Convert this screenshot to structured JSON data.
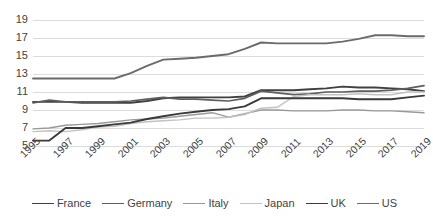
{
  "chart_data": {
    "type": "line",
    "title": "",
    "subtitle": "",
    "xlabel": "",
    "ylabel": "",
    "grid": true,
    "legend_position": "bottom",
    "ylim": [
      5,
      19
    ],
    "yticks": [
      5,
      7,
      9,
      11,
      13,
      15,
      17,
      19
    ],
    "xticks": [
      "1995",
      "1997",
      "1999",
      "2001",
      "2003",
      "2005",
      "2007",
      "2009",
      "2011",
      "2013",
      "2015",
      "2017",
      "2019"
    ],
    "x": [
      1995,
      1996,
      1997,
      1998,
      1999,
      2000,
      2001,
      2002,
      2003,
      2004,
      2005,
      2006,
      2007,
      2008,
      2009,
      2010,
      2011,
      2012,
      2013,
      2014,
      2015,
      2016,
      2017,
      2018,
      2019
    ],
    "series": [
      {
        "name": "France",
        "color": "#404040",
        "width": 1.9,
        "values": [
          9.9,
          9.9,
          9.9,
          9.8,
          9.8,
          9.8,
          9.8,
          10.0,
          10.3,
          10.4,
          10.4,
          10.4,
          10.4,
          10.5,
          11.2,
          11.2,
          11.2,
          11.3,
          11.4,
          11.6,
          11.5,
          11.5,
          11.4,
          11.3,
          11.1
        ]
      },
      {
        "name": "Germany",
        "color": "#5e5e5e",
        "width": 1.7,
        "values": [
          9.8,
          10.1,
          9.9,
          9.9,
          9.9,
          9.9,
          10.0,
          10.2,
          10.4,
          10.2,
          10.2,
          10.1,
          10.0,
          10.3,
          11.1,
          10.9,
          10.7,
          10.8,
          11.0,
          11.0,
          11.1,
          11.1,
          11.2,
          11.4,
          11.7
        ]
      },
      {
        "name": "Italy",
        "color": "#999999",
        "width": 1.4,
        "values": [
          6.9,
          7.0,
          7.3,
          7.4,
          7.5,
          7.7,
          7.9,
          8.0,
          8.1,
          8.3,
          8.5,
          8.7,
          8.2,
          8.6,
          9.0,
          9.0,
          8.9,
          8.9,
          8.9,
          9.0,
          9.0,
          8.9,
          8.9,
          8.8,
          8.7
        ]
      },
      {
        "name": "Japan",
        "color": "#c2c2c2",
        "width": 1.4,
        "values": [
          6.6,
          6.7,
          6.6,
          6.8,
          7.1,
          7.2,
          7.5,
          7.7,
          7.8,
          7.9,
          8.1,
          8.1,
          8.2,
          8.5,
          9.2,
          9.3,
          10.5,
          10.7,
          10.7,
          10.7,
          10.8,
          10.7,
          10.7,
          11.0,
          11.0
        ]
      },
      {
        "name": "UK",
        "color": "#3a3a3a",
        "width": 1.9,
        "values": [
          5.6,
          5.6,
          7.0,
          7.0,
          7.2,
          7.4,
          7.6,
          8.0,
          8.3,
          8.6,
          8.8,
          9.0,
          9.1,
          9.4,
          10.3,
          10.3,
          10.3,
          10.3,
          10.3,
          10.3,
          10.2,
          10.2,
          10.2,
          10.4,
          10.6
        ]
      },
      {
        "name": "US",
        "color": "#6b6b6b",
        "width": 1.9,
        "values": [
          12.5,
          12.5,
          12.5,
          12.5,
          12.5,
          12.5,
          13.1,
          13.9,
          14.6,
          14.7,
          14.8,
          15.0,
          15.2,
          15.8,
          16.5,
          16.4,
          16.4,
          16.4,
          16.4,
          16.6,
          16.9,
          17.3,
          17.3,
          17.2,
          17.2
        ]
      }
    ]
  },
  "legend": {
    "items": [
      {
        "label": "France"
      },
      {
        "label": "Germany"
      },
      {
        "label": "Italy"
      },
      {
        "label": "Japan"
      },
      {
        "label": "UK"
      },
      {
        "label": "US"
      }
    ]
  }
}
